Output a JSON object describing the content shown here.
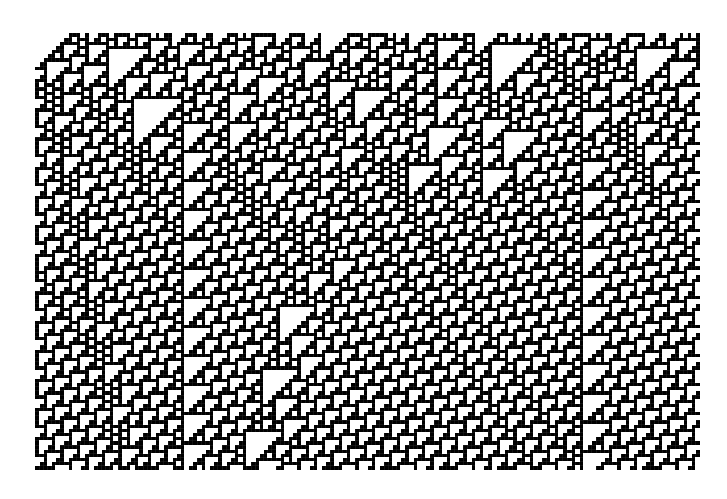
{
  "figure": {
    "kind": "cellular-automaton-evolution",
    "description": "Elementary cellular automaton space-time diagram, black cells on white with faint grid, diagonal white stripes and dark triangular regions",
    "grid": {
      "columns": 160,
      "rows": 105,
      "cell_px": 4.156,
      "origin_px": [
        35,
        33
      ],
      "size_px": [
        665,
        437
      ]
    },
    "rule": 110,
    "initial_condition": "pseudo-random",
    "seed": 20240611,
    "colors": {
      "background": "#ffffff",
      "cell_on": "#000000",
      "grid_line": "#3a3a3a"
    }
  }
}
